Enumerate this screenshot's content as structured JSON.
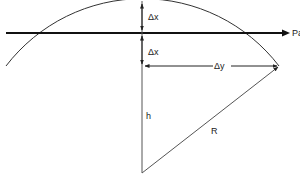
{
  "diagram": {
    "labels": {
      "path": "Path",
      "dx_top": "Δx",
      "dx_bottom": "Δx",
      "dy": "Δy",
      "h": "h",
      "R": "R"
    },
    "colors": {
      "line": "#222222",
      "path_line": "#111111",
      "background": "#ffffff"
    }
  }
}
